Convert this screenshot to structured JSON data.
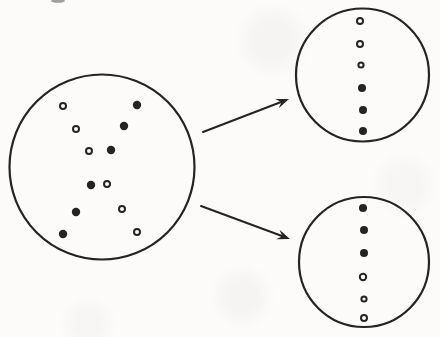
{
  "diagram": {
    "canvas": {
      "width": 440,
      "height": 337
    },
    "ink_color": "#242424",
    "paper_color": "#fcfbf9",
    "cell_stroke_width": 2.2,
    "dot_stroke_width": 2,
    "arrow_stroke_width": 2,
    "arrow_head_length": 13,
    "arrow_head_half_width": 5,
    "parent_cell": {
      "cx": 102,
      "cy": 167,
      "r": 92.5,
      "dots": [
        {
          "x": 63,
          "y": 106,
          "type": "open",
          "r": 3
        },
        {
          "x": 137,
          "y": 105,
          "type": "filled",
          "r": 4.2
        },
        {
          "x": 124,
          "y": 126,
          "type": "filled",
          "r": 4.2
        },
        {
          "x": 76,
          "y": 129,
          "type": "open",
          "r": 3
        },
        {
          "x": 89,
          "y": 151,
          "type": "open",
          "r": 3
        },
        {
          "x": 111,
          "y": 150,
          "type": "filled",
          "r": 4.2
        },
        {
          "x": 91,
          "y": 185,
          "type": "filled",
          "r": 4.2
        },
        {
          "x": 107,
          "y": 184,
          "type": "open",
          "r": 3
        },
        {
          "x": 76,
          "y": 212,
          "type": "filled",
          "r": 4.2
        },
        {
          "x": 122,
          "y": 209,
          "type": "open",
          "r": 3
        },
        {
          "x": 63,
          "y": 234,
          "type": "filled",
          "r": 4.2
        },
        {
          "x": 137,
          "y": 232,
          "type": "open",
          "r": 3
        }
      ]
    },
    "daughter_cells": [
      {
        "id": "top",
        "cx": 362.5,
        "cy": 75,
        "r": 66.5,
        "dots": [
          {
            "x": 360,
            "y": 21,
            "type": "open",
            "r": 3
          },
          {
            "x": 360,
            "y": 44,
            "type": "open",
            "r": 3
          },
          {
            "x": 361,
            "y": 65,
            "type": "open",
            "r": 2.6
          },
          {
            "x": 362,
            "y": 88,
            "type": "filled",
            "r": 4
          },
          {
            "x": 363,
            "y": 110,
            "type": "filled",
            "r": 4
          },
          {
            "x": 363,
            "y": 131,
            "type": "filled",
            "r": 4
          }
        ]
      },
      {
        "id": "bottom",
        "cx": 364,
        "cy": 262,
        "r": 65,
        "dots": [
          {
            "x": 363,
            "y": 208,
            "type": "filled",
            "r": 4
          },
          {
            "x": 364,
            "y": 230,
            "type": "filled",
            "r": 4
          },
          {
            "x": 364,
            "y": 253,
            "type": "filled",
            "r": 4
          },
          {
            "x": 363,
            "y": 277,
            "type": "open",
            "r": 3.2
          },
          {
            "x": 364,
            "y": 299,
            "type": "open",
            "r": 2.6
          },
          {
            "x": 364,
            "y": 318,
            "type": "open",
            "r": 3
          }
        ]
      }
    ],
    "arrows": [
      {
        "id": "arrow-to-top-cell",
        "x1": 203,
        "y1": 132,
        "x2": 289,
        "y2": 99
      },
      {
        "id": "arrow-to-bottom-cell",
        "x1": 201,
        "y1": 206,
        "x2": 290,
        "y2": 239
      }
    ],
    "scan_smudge": {
      "cx": 58,
      "cy": 1,
      "rx": 7,
      "ry": 1.8,
      "color": "#555555",
      "opacity": 0.55
    }
  }
}
